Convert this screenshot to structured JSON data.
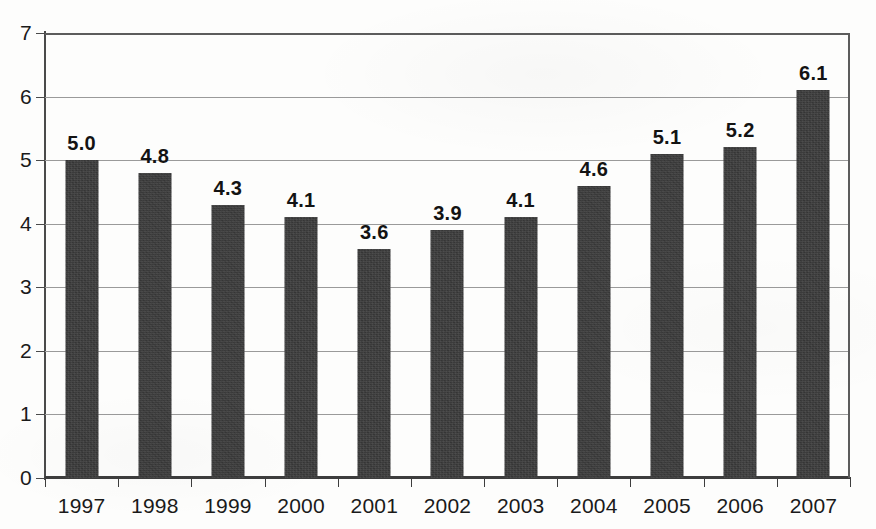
{
  "chart_data": {
    "type": "bar",
    "title": "",
    "subtitle": "",
    "xlabel": "",
    "ylabel": "",
    "categories": [
      "1997",
      "1998",
      "1999",
      "2000",
      "2001",
      "2002",
      "2003",
      "2004",
      "2005",
      "2006",
      "2007"
    ],
    "values": [
      5.0,
      4.8,
      4.3,
      4.1,
      3.6,
      3.9,
      4.1,
      4.6,
      5.1,
      5.2,
      6.1
    ],
    "data_labels": [
      "5.0",
      "4.8",
      "4.3",
      "4.1",
      "3.6",
      "3.9",
      "4.1",
      "4.6",
      "5.1",
      "5.2",
      "6.1"
    ],
    "ylim": [
      0,
      7
    ],
    "ytick_values": [
      0,
      1,
      2,
      3,
      4,
      5,
      6,
      7
    ],
    "ytick_labels": [
      "0",
      "1",
      "2",
      "3",
      "4",
      "5",
      "6",
      "7"
    ],
    "grid": true,
    "grid_axis": "y",
    "legend": false,
    "legend_position": "none",
    "bar_color": "#3b3b3b",
    "grid_color": "#9a9a9a",
    "axis_color": "#3d3d3d",
    "background_color": "#fdfdfc",
    "label_color": "#131313"
  }
}
